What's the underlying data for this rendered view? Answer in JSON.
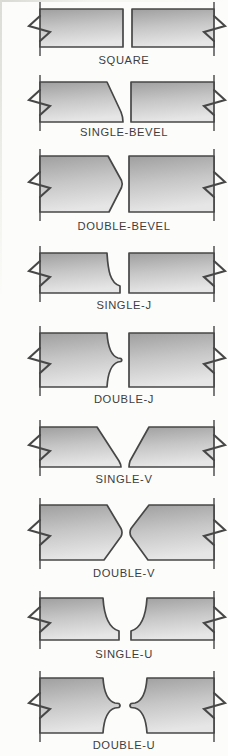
{
  "joints": [
    {
      "label": "SQUARE"
    },
    {
      "label": "SINGLE-BEVEL"
    },
    {
      "label": "DOUBLE-BEVEL"
    },
    {
      "label": "SINGLE-J"
    },
    {
      "label": "DOUBLE-J"
    },
    {
      "label": "SINGLE-V"
    },
    {
      "label": "DOUBLE-V"
    },
    {
      "label": "SINGLE-U"
    },
    {
      "label": "DOUBLE-U"
    }
  ],
  "colors": {
    "plate_gradient_top": "#9f9f9f",
    "plate_gradient_mid": "#c6c6c6",
    "plate_gradient_bottom": "#e6e6e6",
    "outline": "#474747",
    "label_text": "#3d3d3d",
    "background": "#fcfcfa"
  }
}
